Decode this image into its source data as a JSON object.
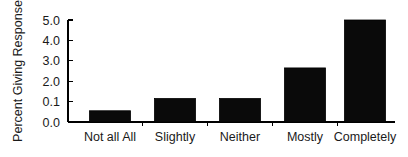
{
  "chart_data": {
    "type": "bar",
    "title": "",
    "subtitle": "",
    "xlabel": "",
    "ylabel": "Percent Giving Response",
    "categories": [
      "Not all All",
      "Slightly",
      "Neither",
      "Mostly",
      "Completely"
    ],
    "values": [
      0.55,
      1.15,
      1.15,
      2.65,
      5.0
    ],
    "ytick_labels": [
      "0.0",
      "0.1",
      "2.0",
      "3.0",
      "4.0",
      "5.0"
    ],
    "ytick_slots": [
      0,
      1,
      2,
      3,
      4,
      5
    ],
    "ylim": [
      0,
      5
    ],
    "grid": false,
    "legend": null,
    "legend_position": "none",
    "bar_color": "#0a0a0a",
    "axis_color": "#000000",
    "background_color": "#ffffff"
  },
  "geometry": {
    "plot_left": 68,
    "plot_right": 395,
    "baseline_y": 122,
    "top_y": 20,
    "bar_width": 41,
    "bar_centers": [
      110,
      175,
      240,
      305,
      365
    ],
    "xtick_positions": [
      142.5,
      207.5,
      272.5,
      337.5
    ],
    "ylabel_x": 22,
    "ylabel_y": 71,
    "xtick_label_y": 141,
    "ytick_label_x": 60
  }
}
